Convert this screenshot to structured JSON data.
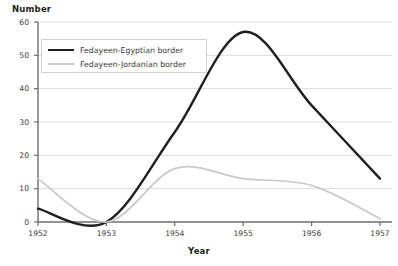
{
  "chart_data": {
    "type": "line",
    "title": "",
    "xlabel": "Year",
    "ylabel": "Number",
    "xlim": [
      1952,
      1957
    ],
    "ylim": [
      0,
      60
    ],
    "ytick_labels": [
      "0",
      "10",
      "20",
      "30",
      "40",
      "50",
      "60"
    ],
    "yticks": [
      0,
      10,
      20,
      30,
      40,
      50,
      60
    ],
    "xtick_labels": [
      "1952",
      "1953",
      "1954",
      "1955",
      "1956",
      "1957"
    ],
    "xticks": [
      1952,
      1953,
      1954,
      1955,
      1956,
      1957
    ],
    "grid": true,
    "grid_axis": "y",
    "legend_position": "upper left",
    "categories": [
      1952,
      1953,
      1954,
      1955,
      1956,
      1957
    ],
    "series": [
      {
        "name": "Fedayeen-Egyptian border",
        "color": "#231f20",
        "values": [
          4,
          0,
          27,
          57,
          35,
          13
        ]
      },
      {
        "name": "Fedayeen-Jordanian border",
        "color": "#c9c9cc",
        "values": [
          13,
          0,
          16,
          13,
          11,
          1
        ]
      }
    ]
  },
  "colors": {
    "grid": "#dddddd",
    "axis": "#6d6e71",
    "text": "#3a3a3c",
    "title_text": "#231f20",
    "legend_border": "#d2d0d6",
    "background": "#ffffff"
  },
  "legend": {
    "entries": [
      {
        "label": "Fedayeen-Egyptian border"
      },
      {
        "label": "Fedayeen-Jordanian border"
      }
    ]
  }
}
